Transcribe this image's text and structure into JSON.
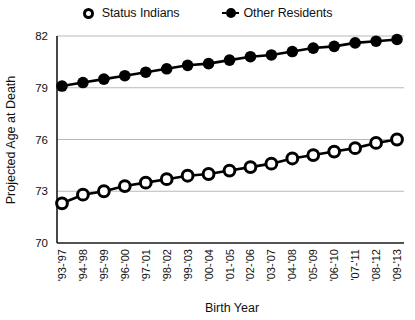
{
  "legend": {
    "position": "top-center",
    "entries": [
      {
        "label": "Status Indians",
        "marker": "hollow-circle-icon"
      },
      {
        "label": "Other Residents",
        "marker": "filled-circle-icon"
      }
    ]
  },
  "chart_data": {
    "type": "line",
    "title": "",
    "xlabel": "Birth Year",
    "ylabel": "Projected Age at Death",
    "ylim": [
      70,
      82
    ],
    "yticks": [
      70,
      73,
      76,
      79,
      82
    ],
    "grid": true,
    "categories": [
      "'93-'97",
      "'94-'98",
      "'95-'99",
      "'96-'00",
      "'97-'01",
      "'98-'02",
      "'99-'03",
      "'00-'04",
      "'01-'05",
      "'02-'06",
      "'03-'07",
      "'04-'08",
      "'05-'09",
      "'06-'10",
      "'07-'11",
      "'08-'12",
      "'09-'13"
    ],
    "series": [
      {
        "name": "Status Indians",
        "marker": "hollow-circle",
        "values": [
          72.3,
          72.8,
          73.0,
          73.3,
          73.5,
          73.7,
          73.9,
          74.0,
          74.2,
          74.4,
          74.6,
          74.9,
          75.1,
          75.3,
          75.5,
          75.8,
          76.0
        ]
      },
      {
        "name": "Other Residents",
        "marker": "filled-circle",
        "values": [
          79.1,
          79.3,
          79.5,
          79.7,
          79.9,
          80.1,
          80.3,
          80.4,
          80.6,
          80.8,
          80.9,
          81.1,
          81.3,
          81.4,
          81.6,
          81.7,
          81.8
        ]
      }
    ]
  }
}
